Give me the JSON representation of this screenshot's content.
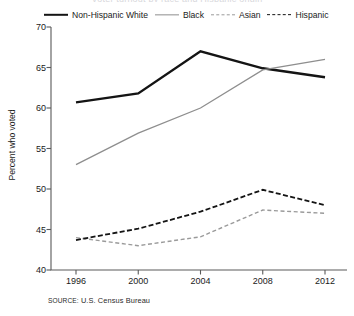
{
  "figure": {
    "title_remnant": "Voter turnout by race and Hispanic origin",
    "source": {
      "keyword": "SOURCE:",
      "text": "U.S. Census Bureau"
    }
  },
  "chart_data": {
    "type": "line",
    "title": "",
    "xlabel": "",
    "ylabel": "Percent who voted",
    "categories": [
      "1996",
      "2000",
      "2004",
      "2008",
      "2012"
    ],
    "x": [
      1996,
      2000,
      2004,
      2008,
      2012
    ],
    "ylim": [
      40,
      70
    ],
    "yticks": [
      40,
      45,
      50,
      55,
      60,
      65,
      70
    ],
    "grid": false,
    "legend_position": "top",
    "series": [
      {
        "name": "Non-Hispanic White",
        "values": [
          60.7,
          61.8,
          67.0,
          64.9,
          63.8
        ],
        "color": "#141414",
        "width": 2.4,
        "dash": "none"
      },
      {
        "name": "Black",
        "values": [
          53.0,
          56.9,
          60.0,
          64.7,
          66.0
        ],
        "color": "#8e8e8e",
        "width": 1.3,
        "dash": "none"
      },
      {
        "name": "Asian",
        "values": [
          44.0,
          43.0,
          44.1,
          47.4,
          47.0
        ],
        "color": "#9a9a9a",
        "width": 1.4,
        "dash": "4,2.6"
      },
      {
        "name": "Hispanic",
        "values": [
          43.7,
          45.1,
          47.2,
          49.9,
          48.0
        ],
        "color": "#141414",
        "width": 1.8,
        "dash": "5,2.4"
      }
    ]
  }
}
